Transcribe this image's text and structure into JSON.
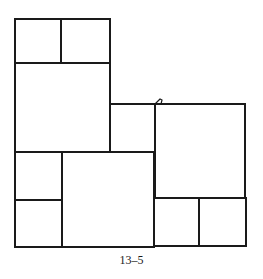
{
  "figure": {
    "caption": "13–5",
    "stroke_color": "#1a1a1a",
    "background": "#ffffff",
    "squares": [
      {
        "id": "top-left-a",
        "x": 15,
        "y": 19,
        "w": 46,
        "h": 44
      },
      {
        "id": "top-left-b",
        "x": 61,
        "y": 19,
        "w": 49,
        "h": 44
      },
      {
        "id": "left-large",
        "x": 15,
        "y": 63,
        "w": 95,
        "h": 89
      },
      {
        "id": "center-small",
        "x": 110,
        "y": 104,
        "w": 45,
        "h": 48
      },
      {
        "id": "right-large",
        "x": 155,
        "y": 104,
        "w": 90,
        "h": 94
      },
      {
        "id": "bottom-left-a",
        "x": 15,
        "y": 152,
        "w": 47,
        "h": 48
      },
      {
        "id": "bottom-left-b",
        "x": 15,
        "y": 200,
        "w": 47,
        "h": 47
      },
      {
        "id": "bottom-middle",
        "x": 62,
        "y": 152,
        "w": 92,
        "h": 95
      },
      {
        "id": "bottom-right-a",
        "x": 154,
        "y": 198,
        "w": 45,
        "h": 48
      },
      {
        "id": "bottom-right-b",
        "x": 199,
        "y": 198,
        "w": 47,
        "h": 48
      }
    ]
  }
}
